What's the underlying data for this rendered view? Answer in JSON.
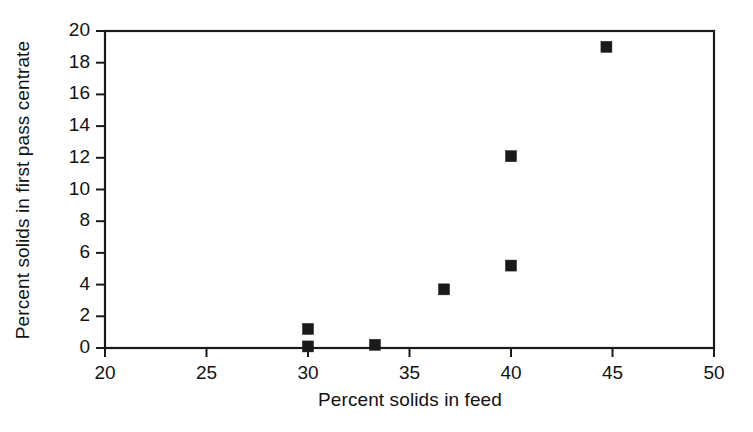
{
  "chart_data": {
    "type": "scatter",
    "title": "",
    "xlabel": "Percent solids in feed",
    "ylabel": "Percent solids in first pass centrate",
    "xlim": [
      20,
      50
    ],
    "ylim": [
      0,
      20
    ],
    "xticks": [
      20,
      25,
      30,
      35,
      40,
      45,
      50
    ],
    "yticks": [
      0,
      2,
      4,
      6,
      8,
      10,
      12,
      14,
      16,
      18,
      20
    ],
    "xtick_labels": [
      "20",
      "25",
      "30",
      "35",
      "40",
      "45",
      "50"
    ],
    "ytick_labels": [
      "0",
      "2",
      "4",
      "6",
      "8",
      "10",
      "12",
      "14",
      "16",
      "18",
      "20"
    ],
    "grid": false,
    "legend": false,
    "marker": {
      "shape": "square",
      "color": "#1a1a1a",
      "size_px": 11
    },
    "series": [
      {
        "name": "first pass centrate solids",
        "points": [
          {
            "x": 30.0,
            "y": 1.2
          },
          {
            "x": 30.0,
            "y": 0.1
          },
          {
            "x": 33.3,
            "y": 0.2
          },
          {
            "x": 36.7,
            "y": 3.7
          },
          {
            "x": 40.0,
            "y": 5.2
          },
          {
            "x": 40.0,
            "y": 12.1
          },
          {
            "x": 44.7,
            "y": 19.0
          }
        ]
      }
    ],
    "axis_color": "#1a1a1a",
    "background": "#ffffff"
  }
}
